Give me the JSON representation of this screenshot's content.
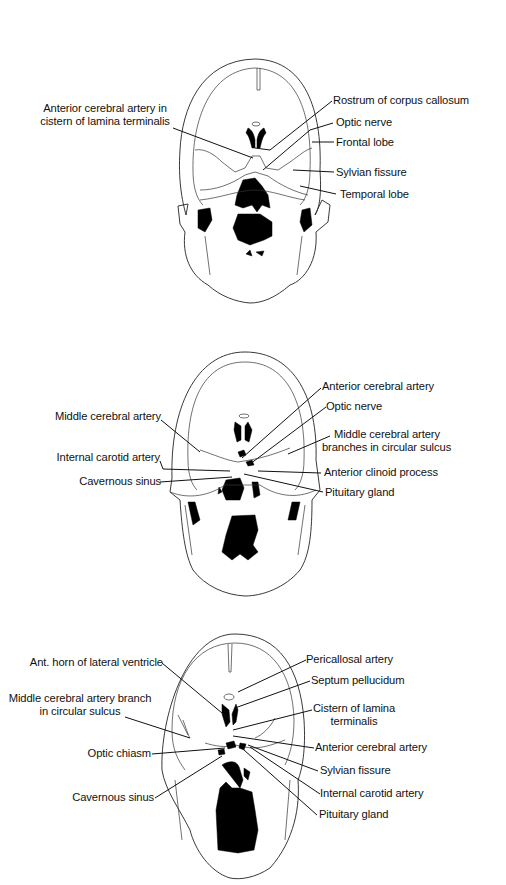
{
  "figure": {
    "panels": [
      {
        "id": "panel-1",
        "labels": {
          "left": [
            {
              "text": "Anterior cerebral artery in",
              "text2": "cistern of lamina terminalis"
            }
          ],
          "right": [
            {
              "text": "Rostrum of corpus callosum"
            },
            {
              "text": "Optic nerve"
            },
            {
              "text": "Frontal lobe"
            },
            {
              "text": "Sylvian fissure"
            },
            {
              "text": "Temporal lobe"
            }
          ]
        }
      },
      {
        "id": "panel-2",
        "labels": {
          "left": [
            {
              "text": "Middle cerebral artery"
            },
            {
              "text": "Internal carotid artery"
            },
            {
              "text": "Cavernous sinus"
            }
          ],
          "right": [
            {
              "text": "Anterior cerebral artery"
            },
            {
              "text": "Optic nerve"
            },
            {
              "text": "Middle cerebral artery",
              "text2": "branches in circular sulcus"
            },
            {
              "text": "Anterior clinoid process"
            },
            {
              "text": "Pituitary gland"
            }
          ]
        }
      },
      {
        "id": "panel-3",
        "labels": {
          "left": [
            {
              "text": "Ant. horn of lateral ventricle"
            },
            {
              "text": "Middle cerebral artery branch",
              "text2": "in circular sulcus"
            },
            {
              "text": "Optic chiasm"
            },
            {
              "text": "Cavernous sinus"
            }
          ],
          "right": [
            {
              "text": "Pericallosal artery"
            },
            {
              "text": "Septum pellucidum"
            },
            {
              "text": "Cistern of lamina",
              "text2": "terminalis"
            },
            {
              "text": "Anterior cerebral artery"
            },
            {
              "text": "Sylvian fissure"
            },
            {
              "text": "Internal carotid artery"
            },
            {
              "text": "Pituitary gland"
            }
          ]
        }
      }
    ]
  }
}
